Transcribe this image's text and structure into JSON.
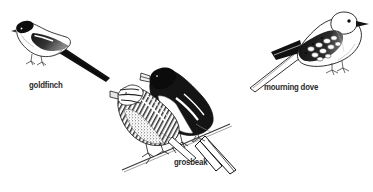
{
  "figure": {
    "background_color": "#ffffff",
    "ink_color": "#1a1a1a",
    "label_color": "#2b2b2b",
    "width": 373,
    "height": 192,
    "style": "pen-and-ink stipple bird illustration"
  },
  "birds": [
    {
      "id": "goldfinch",
      "label": "goldfinch",
      "position": "upper-left",
      "facing": "left",
      "description": "American goldfinch perched, black cap and black wings with white wingbar, long pointed dark tail angled down to the right"
    },
    {
      "id": "grosbeak",
      "label": "grosbeak",
      "position": "center-lower",
      "facing": "left",
      "count": 2,
      "description": "Pair of rose-breasted grosbeaks on a twig: dark-headed male behind and streaked brown female in front, heavy conical pale beaks, forked white-edged tail angled down to the right"
    },
    {
      "id": "mourning-dove",
      "label": "mourning dove",
      "position": "upper-right",
      "facing": "right",
      "description": "Mourning dove perched, small round head with dark eye, spotted scapular feathers, long tapered pointed tail angled down to the left"
    }
  ],
  "labels": {
    "goldfinch": "goldfinch",
    "grosbeak": "grosbeak",
    "mourning_dove": "mourning dove"
  }
}
